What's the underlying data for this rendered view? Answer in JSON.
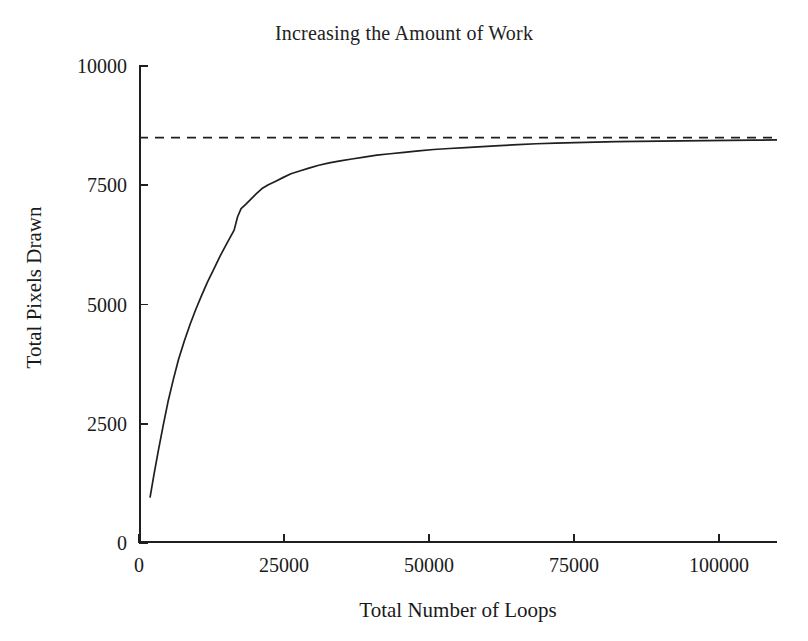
{
  "chart_data": {
    "type": "line",
    "title": "Increasing the Amount of Work",
    "xlabel": "Total Number of Loops",
    "ylabel": "Total Pixels Drawn",
    "xlim": [
      0,
      110000
    ],
    "ylim": [
      0,
      10000
    ],
    "grid": false,
    "legend": null,
    "xticks": [
      0,
      25000,
      50000,
      75000,
      100000
    ],
    "xtick_labels": [
      "0",
      "25000",
      "50000",
      "75000",
      "100000"
    ],
    "yticks": [
      0,
      2500,
      5000,
      7500,
      10000
    ],
    "ytick_labels": [
      "0",
      "2500",
      "5000",
      "7500",
      "10000"
    ],
    "series": [
      {
        "name": "Total Pixels Drawn",
        "style": "solid",
        "color": "#1f1f1f",
        "x": [
          1900,
          2600,
          3400,
          4200,
          5000,
          5900,
          6800,
          7800,
          8800,
          9800,
          10800,
          11800,
          12900,
          14000,
          15200,
          16400,
          17000,
          17600,
          18400,
          19300,
          20200,
          21200,
          22300,
          23500,
          24800,
          26200,
          27700,
          29300,
          31000,
          32800,
          34700,
          36700,
          38800,
          41000,
          43300,
          45700,
          48200,
          50800,
          53500,
          56300,
          59200,
          62200,
          65300,
          68500,
          71800,
          75200,
          78700,
          82300,
          86000,
          89800,
          93700,
          97700,
          101800,
          106000,
          110000
        ],
        "y": [
          950,
          1450,
          1980,
          2480,
          2960,
          3420,
          3840,
          4230,
          4580,
          4900,
          5190,
          5470,
          5740,
          6020,
          6290,
          6560,
          6840,
          7010,
          7100,
          7210,
          7320,
          7430,
          7510,
          7580,
          7660,
          7740,
          7800,
          7860,
          7920,
          7970,
          8010,
          8050,
          8090,
          8130,
          8160,
          8190,
          8220,
          8250,
          8270,
          8290,
          8310,
          8330,
          8350,
          8370,
          8385,
          8395,
          8405,
          8415,
          8420,
          8425,
          8430,
          8435,
          8440,
          8445,
          8450
        ]
      },
      {
        "name": "Asymptote",
        "style": "dashed",
        "color": "#1f1f1f",
        "x": [
          0,
          110000
        ],
        "y": [
          8500,
          8500
        ]
      }
    ],
    "asymptote_value": 8500
  }
}
